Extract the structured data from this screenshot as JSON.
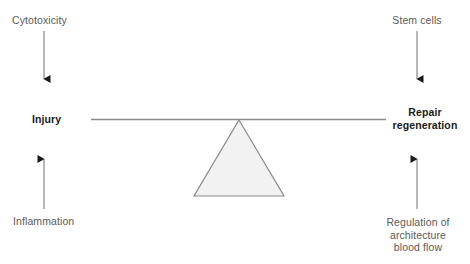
{
  "diagram": {
    "colors": {
      "label_gray": "#5a5a5a",
      "label_dark": "#1a1a1a",
      "line_gray": "#8c8c8c",
      "arrow_black": "#1a1a1a",
      "triangle_fill": "#f2f2f2",
      "triangle_stroke": "#8a8a8a",
      "background": "#ffffff"
    },
    "left_side": {
      "top_label": "Cytotoxicity",
      "pan_label": "Injury",
      "bottom_label": "Inflammation",
      "top_arrow_direction": "down",
      "bottom_arrow_direction": "up"
    },
    "right_side": {
      "top_label": "Stem cells",
      "pan_label_line1": "Repair",
      "pan_label_line2": "regeneration",
      "bottom_label_line1": "Regulation of",
      "bottom_label_line2": "architecture",
      "bottom_label_line3": "blood flow",
      "top_arrow_direction": "down",
      "bottom_arrow_direction": "up"
    },
    "fulcrum": {
      "shape": "triangle",
      "beam": "horizontal-balance-beam"
    }
  }
}
